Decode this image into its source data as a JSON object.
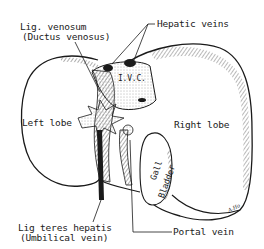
{
  "figure": {
    "artist_signature": "A.Ho",
    "labels": {
      "lig_venosum": "Lig. venosum",
      "ductus_venosus": "(Ductus venosus)",
      "hepatic_veins": "Hepatic veins",
      "ivc": "I.V.C.",
      "left_lobe": "Left lobe",
      "right_lobe": "Right lobe",
      "gall": "Gall",
      "bladder": "Bladder",
      "lig_teres": "Lig teres hepatis",
      "umbilical_vein": "(Umbilical vein)",
      "portal_vein": "Portal vein"
    },
    "colors": {
      "ink": "#1a1a1a",
      "paper": "#ffffff",
      "shading": "#555555"
    }
  }
}
